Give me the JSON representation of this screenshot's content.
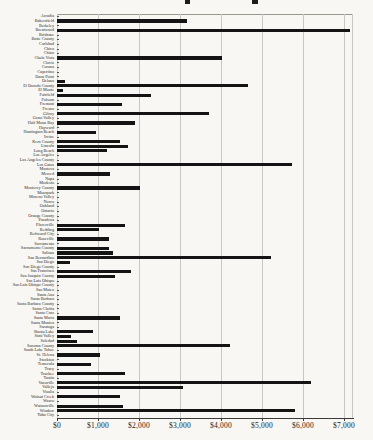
{
  "chart_data": {
    "type": "bar",
    "orientation": "horizontal",
    "title": "",
    "title_note": "title cropped out of frame; only letter descender fragments visible at top edge",
    "xlabel": "",
    "ylabel": "",
    "grid": true,
    "bar_color": "#141414",
    "background_color": "#f8f7f3",
    "gridline_color": "#c9c7c1",
    "xlim": [
      0,
      7270
    ],
    "x_tick_values": [
      0,
      1000,
      2000,
      3000,
      4000,
      5000,
      6000,
      7000
    ],
    "x_tick_labels": [
      "$0",
      "$1,000",
      "$2,000",
      "$3,000",
      "$4,000",
      "$5,000",
      "$6,000",
      "$7,000"
    ],
    "categories": [
      "Arcadia",
      "Bakersfield",
      "Berkeley",
      "Brentwood",
      "Brisbane",
      "Butte County",
      "Carlsbad",
      "Chico",
      "Chino",
      "Chula Vista",
      "Clovis",
      "Corona",
      "Cupertino",
      "Dana Point",
      "Delano",
      "El Dorado County",
      "El Monte",
      "Fairfield",
      "Folsom",
      "Fremont",
      "Fresno",
      "Gilroy",
      "Grass Valley",
      "Half Moon Bay",
      "Hayward",
      "Huntington Beach",
      "Irvine",
      "Kern County",
      "Lincoln",
      "Long Beach",
      "Los Angeles",
      "Los Angeles County",
      "Los Gatos",
      "Manteca",
      "Merced",
      "Napa",
      "Modesto",
      "Monterey County",
      "Moorpark",
      "Moreno Valley",
      "Norco",
      "Oakland",
      "Ontario",
      "Orange County",
      "Pasadena",
      "Placerville",
      "Redding",
      "Redwood City",
      "Roseville",
      "Sacramento",
      "Sacramento County",
      "Salinas",
      "San Bernardino",
      "San Diego",
      "San Diego County",
      "San Francisco",
      "San Joaquin County",
      "San Luis Obispo",
      "San Luis Obispo County",
      "San Mateo",
      "Santa Ana",
      "Santa Barbara",
      "Santa Barbara County",
      "Santa Clarita",
      "Santa Cruz",
      "Santa Maria",
      "Santa Monica",
      "Saratoga",
      "Shasta Lake",
      "Simi Valley",
      "Soledad",
      "Sonoma County",
      "South Lake Tahoe",
      "St. Helena",
      "Stockton",
      "Temecula",
      "Tracy",
      "Truckee",
      "Tustin",
      "Vacaville",
      "Vallejo",
      "Visalia",
      "Walnut Creek",
      "Wasco",
      "Watsonville",
      "Windsor",
      "Yuba City"
    ],
    "values": [
      0,
      3180,
      0,
      7150,
      0,
      0,
      0,
      0,
      0,
      4030,
      0,
      0,
      0,
      0,
      200,
      4660,
      150,
      2300,
      0,
      1590,
      0,
      3700,
      0,
      1910,
      0,
      960,
      0,
      1530,
      1730,
      1230,
      0,
      0,
      5720,
      0,
      1300,
      0,
      0,
      2020,
      0,
      0,
      0,
      0,
      0,
      0,
      0,
      1650,
      1020,
      0,
      1260,
      0,
      1280,
      1370,
      5230,
      310,
      0,
      1810,
      1410,
      0,
      0,
      0,
      0,
      0,
      0,
      0,
      0,
      1540,
      0,
      0,
      890,
      330,
      490,
      4210,
      0,
      1060,
      0,
      840,
      0,
      1650,
      0,
      6200,
      3070,
      0,
      1530,
      0,
      1610,
      5800,
      0
    ]
  },
  "layout": {
    "plot_left_px": 57,
    "plot_top_px": 14,
    "plot_width_px": 296,
    "plot_height_px": 404,
    "px_per_1000_dollars": 41
  }
}
